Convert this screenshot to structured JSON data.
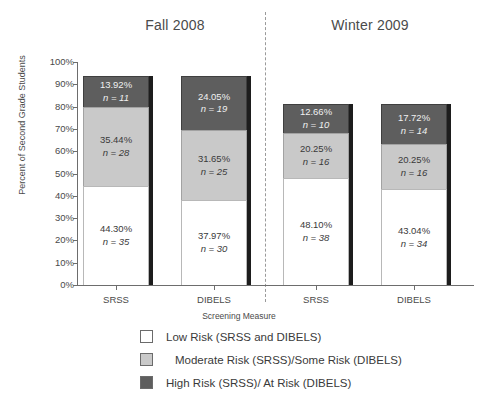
{
  "chart_data": {
    "type": "bar",
    "subtype": "stacked-percentage",
    "title": "",
    "panels": [
      {
        "id": "fall",
        "label": "Fall 2008"
      },
      {
        "id": "winter",
        "label": "Winter 2009"
      }
    ],
    "categories": [
      "SRSS",
      "DIBELS",
      "SRSS",
      "DIBELS"
    ],
    "xlabel": "Screening Measure",
    "ylabel": "Percent of Second Grade Students",
    "ylim": [
      0,
      100
    ],
    "yticks": [
      "0%",
      "10%",
      "20%",
      "30%",
      "40%",
      "50%",
      "60%",
      "70%",
      "80%",
      "90%",
      "100%"
    ],
    "grid": false,
    "legend_position": "bottom",
    "series": [
      {
        "name": "Low Risk (SRSS and DIBELS)",
        "key": "low",
        "color": "#ffffff",
        "values": [
          44.3,
          37.97,
          48.1,
          43.04
        ],
        "counts": [
          35,
          30,
          38,
          34
        ]
      },
      {
        "name": "Moderate Risk (SRSS)/Some Risk (DIBELS)",
        "key": "moderate",
        "color": "#c9c9c9",
        "values": [
          35.44,
          31.65,
          20.25,
          20.25
        ],
        "counts": [
          28,
          25,
          16,
          16
        ]
      },
      {
        "name": "High Risk (SRSS)/ At Risk (DIBELS)",
        "key": "high",
        "color": "#5e5e5e",
        "values": [
          13.92,
          24.05,
          12.66,
          17.72
        ],
        "counts": [
          11,
          19,
          10,
          14
        ]
      }
    ]
  },
  "titles": {
    "fall": "Fall 2008",
    "winter": "Winter 2009"
  },
  "axes": {
    "y_label": "Percent of Second Grade Students",
    "x_label": "Screening Measure",
    "y_ticks": [
      "100%",
      "90%",
      "80%",
      "70%",
      "60%",
      "50%",
      "40%",
      "30%",
      "20%",
      "10%",
      "0%"
    ],
    "x_ticks": [
      "SRSS",
      "DIBELS",
      "SRSS",
      "DIBELS"
    ]
  },
  "bars": [
    {
      "id": "fall-srss",
      "category": "SRSS",
      "panel": "Fall 2008",
      "segments": [
        {
          "key": "high",
          "pct": "13.92%",
          "n": "n = 11",
          "value": 13.92
        },
        {
          "key": "moderate",
          "pct": "35.44%",
          "n": "n = 28",
          "value": 35.44
        },
        {
          "key": "low",
          "pct": "44.30%",
          "n": "n = 35",
          "value": 44.3
        }
      ]
    },
    {
      "id": "fall-dibels",
      "category": "DIBELS",
      "panel": "Fall 2008",
      "segments": [
        {
          "key": "high",
          "pct": "24.05%",
          "n": "n = 19",
          "value": 24.05
        },
        {
          "key": "moderate",
          "pct": "31.65%",
          "n": "n = 25",
          "value": 31.65
        },
        {
          "key": "low",
          "pct": "37.97%",
          "n": "n = 30",
          "value": 37.97
        }
      ]
    },
    {
      "id": "winter-srss",
      "category": "SRSS",
      "panel": "Winter 2009",
      "segments": [
        {
          "key": "high",
          "pct": "12.66%",
          "n": "n = 10",
          "value": 12.66
        },
        {
          "key": "moderate",
          "pct": "20.25%",
          "n": "n = 16",
          "value": 20.25
        },
        {
          "key": "low",
          "pct": "48.10%",
          "n": "n = 38",
          "value": 48.1
        }
      ]
    },
    {
      "id": "winter-dibels",
      "category": "DIBELS",
      "panel": "Winter 2009",
      "segments": [
        {
          "key": "high",
          "pct": "17.72%",
          "n": "n = 14",
          "value": 17.72
        },
        {
          "key": "moderate",
          "pct": "20.25%",
          "n": "n = 16",
          "value": 20.25
        },
        {
          "key": "low",
          "pct": "43.04%",
          "n": "n = 34",
          "value": 43.04
        }
      ]
    }
  ],
  "legend": {
    "items": [
      {
        "key": "low",
        "label": "Low Risk (SRSS and DIBELS)",
        "color": "#ffffff"
      },
      {
        "key": "moderate",
        "label": "Moderate Risk (SRSS)/Some Risk (DIBELS)",
        "color": "#c9c9c9"
      },
      {
        "key": "high",
        "label": "High Risk (SRSS)/ At Risk (DIBELS)",
        "color": "#5e5e5e"
      }
    ]
  }
}
